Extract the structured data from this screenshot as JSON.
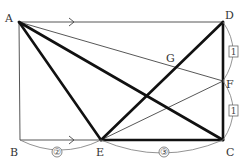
{
  "diagram": {
    "type": "geometry-rectangle",
    "points": {
      "A": {
        "label": "A",
        "x": 19,
        "y": 22
      },
      "B": {
        "label": "B",
        "x": 20,
        "y": 140
      },
      "C": {
        "label": "C",
        "x": 223,
        "y": 140
      },
      "D": {
        "label": "D",
        "x": 223,
        "y": 22
      },
      "E": {
        "label": "E",
        "x": 101,
        "y": 140
      },
      "F": {
        "label": "F",
        "x": 223,
        "y": 81
      },
      "G": {
        "label": "G",
        "x": 176,
        "y": 66
      }
    },
    "labels": {
      "A": "A",
      "B": "B",
      "C": "C",
      "D": "D",
      "E": "E",
      "F": "F",
      "G": "G"
    },
    "ratios": {
      "BE": "②",
      "EC": "③",
      "DF": "1",
      "FC": "1"
    },
    "thin_segments": [
      "AD",
      "AB",
      "BE",
      "AF"
    ],
    "thick_segments": [
      "AE",
      "AC",
      "ED",
      "EC",
      "DC"
    ],
    "parallel_marks": [
      "AD",
      "BC"
    ],
    "colors": {
      "thick_line": "#111111",
      "thin_line": "#444444",
      "arc": "#777777",
      "text": "#333333"
    }
  }
}
